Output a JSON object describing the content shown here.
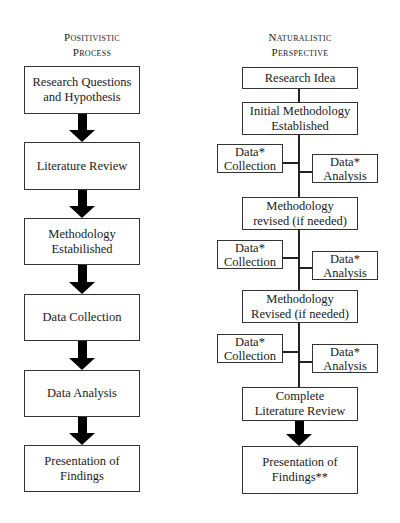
{
  "left_column": {
    "title_line1": "Positivistic",
    "title_line2": "Process",
    "steps": [
      {
        "line1": "Research Questions",
        "line2": "and Hypothesis"
      },
      {
        "line1": "Literature Review",
        "line2": ""
      },
      {
        "line1": "Methodology",
        "line2": "Estabilished"
      },
      {
        "line1": "Data Collection",
        "line2": ""
      },
      {
        "line1": "Data Analysis",
        "line2": ""
      },
      {
        "line1": "Presentation of",
        "line2": "Findings"
      }
    ]
  },
  "right_column": {
    "title_line1": "Naturalistic",
    "title_line2": "Perspective",
    "main_steps": [
      {
        "line1": "Research Idea",
        "line2": ""
      },
      {
        "line1": "Initial Methodology",
        "line2": "Established"
      },
      {
        "line1": "Methodology",
        "line2": "revised (if needed)"
      },
      {
        "line1": "Methodology",
        "line2": "Revised (if needed)"
      },
      {
        "line1": "Complete",
        "line2": "Literature Review"
      },
      {
        "line1": "Presentation of",
        "line2": "Findings**"
      }
    ],
    "cycles": [
      {
        "collection_line1": "Data*",
        "collection_line2": "Collection",
        "analysis_line1": "Data*",
        "analysis_line2": "Analysis"
      },
      {
        "collection_line1": "Data*",
        "collection_line2": "Collection",
        "analysis_line1": "Data*",
        "analysis_line2": "Analysis"
      },
      {
        "collection_line1": "Data*",
        "collection_line2": "Collection",
        "analysis_line1": "Data*",
        "analysis_line2": "Analysis"
      }
    ]
  },
  "colors": {
    "border": "#333333",
    "arrow": "#000000",
    "background": "#ffffff"
  }
}
